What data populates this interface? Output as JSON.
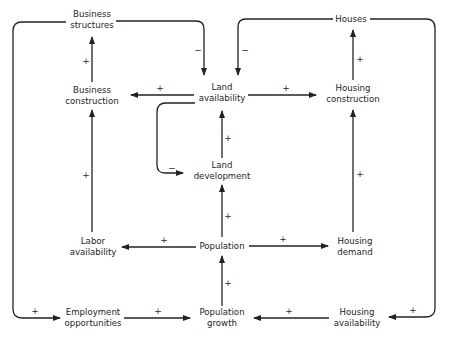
{
  "diagram": {
    "type": "causal-loop",
    "nodes": {
      "business_structures": {
        "line1": "Business",
        "line2": "structures"
      },
      "houses": {
        "line1": "Houses",
        "line2": ""
      },
      "business_construction": {
        "line1": "Business",
        "line2": "construction"
      },
      "land_availability": {
        "line1": "Land",
        "line2": "availability"
      },
      "housing_construction": {
        "line1": "Housing",
        "line2": "construction"
      },
      "land_development": {
        "line1": "Land",
        "line2": "development"
      },
      "labor_availability": {
        "line1": "Labor",
        "line2": "availability"
      },
      "population": {
        "line1": "Population",
        "line2": ""
      },
      "housing_demand": {
        "line1": "Housing",
        "line2": "demand"
      },
      "employment_opportunities": {
        "line1": "Employment",
        "line2": "opportunities"
      },
      "population_growth": {
        "line1": "Population",
        "line2": "growth"
      },
      "housing_availability": {
        "line1": "Housing",
        "line2": "availability"
      }
    },
    "edges": [
      {
        "from": "Business construction",
        "to": "Business structures",
        "sign": "+"
      },
      {
        "from": "Business structures",
        "to": "Land availability",
        "sign": "−"
      },
      {
        "from": "Houses",
        "to": "Land availability",
        "sign": "−"
      },
      {
        "from": "Land availability",
        "to": "Business construction",
        "sign": "+"
      },
      {
        "from": "Land availability",
        "to": "Housing construction",
        "sign": "+"
      },
      {
        "from": "Housing construction",
        "to": "Houses",
        "sign": "+"
      },
      {
        "from": "Land availability",
        "to": "Land development",
        "sign": "−"
      },
      {
        "from": "Land development",
        "to": "Land availability",
        "sign": "+"
      },
      {
        "from": "Labor availability",
        "to": "Business construction",
        "sign": "+"
      },
      {
        "from": "Population",
        "to": "Land development",
        "sign": "+"
      },
      {
        "from": "Population",
        "to": "Labor availability",
        "sign": "+"
      },
      {
        "from": "Population",
        "to": "Housing demand",
        "sign": "+"
      },
      {
        "from": "Housing demand",
        "to": "Housing construction",
        "sign": "+"
      },
      {
        "from": "Population growth",
        "to": "Population",
        "sign": "+"
      },
      {
        "from": "Business structures",
        "to": "Employment opportunities",
        "sign": "+"
      },
      {
        "from": "Employment opportunities",
        "to": "Population growth",
        "sign": "+"
      },
      {
        "from": "Houses",
        "to": "Housing availability",
        "sign": "+"
      },
      {
        "from": "Housing availability",
        "to": "Population growth",
        "sign": "+"
      }
    ],
    "signs": {
      "plus": "+",
      "minus": "−"
    }
  }
}
